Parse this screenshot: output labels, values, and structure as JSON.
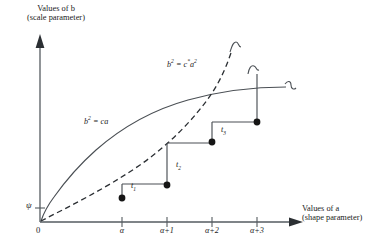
{
  "figure": {
    "type": "math-diagram",
    "background": "#ffffff",
    "ink_color": "#1a1a1a",
    "axes": {
      "y_title_line1": "Values of b",
      "y_title_line2": "(scale parameter)",
      "x_title_line1": "Values of a",
      "x_title_line2": "(shape parameter)",
      "origin_label": "0",
      "psi_label": "ψ"
    },
    "x_ticks": [
      {
        "label": "α",
        "x": 122
      },
      {
        "label": "α+1",
        "x": 167
      },
      {
        "label": "α+2",
        "x": 212
      },
      {
        "label": "α+3",
        "x": 257
      }
    ],
    "curves": [
      {
        "name": "solid-curve",
        "label_base": "b",
        "label_sup": "2",
        "label_rest": " = ca",
        "style": "solid",
        "shape": "concave-increasing",
        "label_x": 84,
        "label_y": 123
      },
      {
        "name": "dashed-curve",
        "label_base": "b",
        "label_sup": "2",
        "label_mid": " = c",
        "label_mid_sup": "*",
        "label_tail": "a",
        "label_tail_sup": "2",
        "style": "dashed",
        "shape": "convex-increasing",
        "label_x": 167,
        "label_y": 66
      }
    ],
    "steps": [
      {
        "name": "t1",
        "label": "t",
        "sub": "1",
        "label_x": 131,
        "label_y": 184,
        "dot_x": 122,
        "dot_y": 198,
        "riser_x": 122,
        "riser_top": 184,
        "riser_bottom": 198,
        "tread_to_x": 167,
        "tread_y": 184
      },
      {
        "name": "t2",
        "label": "t",
        "sub": "2",
        "label_x": 176,
        "label_y": 163,
        "dot_x": 167,
        "dot_y": 185,
        "riser_x": 167,
        "riser_top": 143,
        "riser_bottom": 185,
        "tread_to_x": 212,
        "tread_y": 143
      },
      {
        "name": "t3",
        "label": "t",
        "sub": "3",
        "label_x": 221,
        "label_y": 128,
        "dot_x": 212,
        "dot_y": 142,
        "riser_x": 212,
        "riser_top": 122,
        "riser_bottom": 142,
        "tread_to_x": 257,
        "tread_y": 122
      }
    ],
    "final_step": {
      "name": "t4",
      "dot_x": 257,
      "dot_y": 122,
      "riser_x": 257,
      "riser_top": 72,
      "riser_bottom": 122
    },
    "break_marks": [
      {
        "name": "dashed-curve-break",
        "x": 233,
        "y": 45
      },
      {
        "name": "vertical-line-break",
        "x": 250,
        "y": 70
      },
      {
        "name": "solid-curve-break",
        "x": 290,
        "y": 86
      }
    ]
  }
}
